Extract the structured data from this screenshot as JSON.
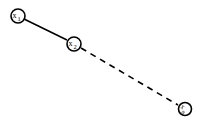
{
  "diagram": {
    "nodes": [
      {
        "id": "x1",
        "label": "x",
        "sub": "1",
        "cx": 18,
        "cy": 16
      },
      {
        "id": "x2",
        "label": "x",
        "sub": "2",
        "cx": 74,
        "cy": 44
      },
      {
        "id": "xn",
        "label": "x",
        "sub": "n",
        "cx": 185,
        "cy": 109
      }
    ],
    "edges": [
      {
        "from": "x1",
        "to": "x2",
        "style": "solid"
      },
      {
        "from": "x2",
        "to": "xn",
        "style": "dashed"
      }
    ],
    "colors": {
      "stroke": "#000000",
      "background": "#ffffff"
    }
  }
}
